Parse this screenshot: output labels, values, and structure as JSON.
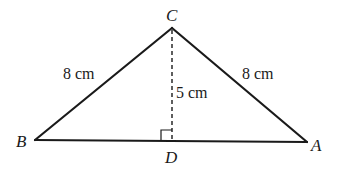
{
  "diagram": {
    "type": "triangle",
    "colors": {
      "stroke": "#1a1a1a",
      "background": "#ffffff"
    },
    "vertices": {
      "C": {
        "label": "C",
        "x": 172,
        "y": 28
      },
      "B": {
        "label": "B",
        "x": 35,
        "y": 140
      },
      "A": {
        "label": "A",
        "x": 307,
        "y": 142
      },
      "D": {
        "label": "D",
        "x": 172,
        "y": 141
      }
    },
    "labels": {
      "C": "C",
      "B": "B",
      "A": "A",
      "D": "D"
    },
    "measurements": {
      "CB": "8 cm",
      "CA": "8 cm",
      "CD": "5 cm"
    },
    "annotations": {
      "altitude": "dashed line from C perpendicular to BA at D",
      "right_angle_marker": "at D"
    }
  }
}
